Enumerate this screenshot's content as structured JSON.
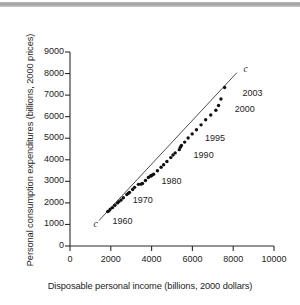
{
  "figure": {
    "artifact_bar": "scan-artifact-bar"
  },
  "chart_data": {
    "type": "scatter",
    "title": "",
    "xlabel": "Disposable personal income (billions, 2000 dollars)",
    "ylabel": "Personal consumption expenditures (billions, 2000 prices)",
    "xlim": [
      0,
      10000
    ],
    "ylim": [
      0,
      9000
    ],
    "xticks": [
      0,
      2000,
      4000,
      6000,
      8000,
      10000
    ],
    "yticks": [
      0,
      1000,
      2000,
      3000,
      4000,
      5000,
      6000,
      7000,
      8000,
      9000
    ],
    "xtick_labels": [
      "0",
      "2000",
      "4000",
      "6000",
      "8000",
      "10000"
    ],
    "ytick_labels": [
      "0",
      "1000",
      "2000",
      "3000",
      "4000",
      "5000",
      "6000",
      "7000",
      "8000",
      "9000"
    ],
    "grid": false,
    "legend": null,
    "series": [
      {
        "name": "Consumption function (annual observations 1960-2003)",
        "marker": "filled-circle",
        "color": "#111111",
        "x": [
          1846,
          1911,
          1974,
          2086,
          2200,
          2330,
          2400,
          2505,
          2616,
          2786,
          2866,
          2915,
          3070,
          3165,
          3353,
          3475,
          3553,
          3700,
          3840,
          3935,
          3980,
          4010,
          4100,
          4285,
          4465,
          4590,
          4750,
          4940,
          5050,
          5155,
          5355,
          5410,
          5460,
          5620,
          5790,
          5990,
          6200,
          6425,
          6650,
          6900,
          7150,
          7280,
          7400,
          7580
        ],
        "y": [
          1597,
          1630,
          1711,
          1782,
          1888,
          2000,
          2060,
          2135,
          2240,
          2390,
          2450,
          2490,
          2620,
          2720,
          2860,
          2870,
          2900,
          3040,
          3180,
          3240,
          3260,
          3280,
          3330,
          3490,
          3650,
          3770,
          3920,
          4100,
          4220,
          4320,
          4470,
          4580,
          4660,
          4820,
          5010,
          5200,
          5390,
          5620,
          5860,
          6080,
          6300,
          6520,
          6820,
          7350
        ]
      },
      {
        "name": "c",
        "type": "line",
        "style": "straight-reference-line",
        "color": "#3a3a3a",
        "x": [
          1420,
          8180
        ],
        "y": [
          1180,
          8040
        ]
      }
    ],
    "annotations": [
      {
        "text": "c",
        "x": 1150,
        "y": 960,
        "style": "italic",
        "name": "curve-label-c-lower"
      },
      {
        "text": "c",
        "x": 8500,
        "y": 8180,
        "style": "italic",
        "name": "curve-label-c-upper"
      },
      {
        "text": "1960",
        "x": 2080,
        "y": 1120,
        "name": "point-label-1960"
      },
      {
        "text": "1970",
        "x": 3080,
        "y": 2080,
        "name": "point-label-1970"
      },
      {
        "text": "1980",
        "x": 4480,
        "y": 2950,
        "name": "point-label-1980"
      },
      {
        "text": "1990",
        "x": 6060,
        "y": 4190,
        "name": "point-label-1990"
      },
      {
        "text": "1995",
        "x": 6620,
        "y": 4960,
        "name": "point-label-1995"
      },
      {
        "text": "2000",
        "x": 8080,
        "y": 6330,
        "name": "point-label-2000"
      },
      {
        "text": "2003",
        "x": 8450,
        "y": 7050,
        "name": "point-label-2003"
      }
    ]
  }
}
